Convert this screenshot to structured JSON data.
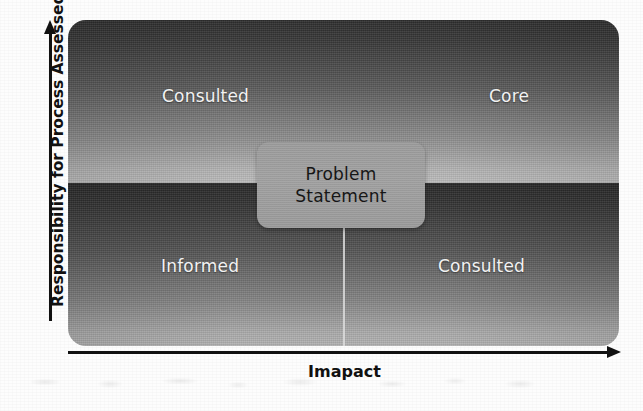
{
  "chart_data": {
    "type": "matrix",
    "title": "",
    "xlabel": "Imapact",
    "ylabel": "Responsibility for Process Assessed",
    "grid": false,
    "legend": "none",
    "axes": {
      "x": {
        "label": "Imapact",
        "arrow": "right",
        "ticks": []
      },
      "y": {
        "label": "Responsibility for Process Assessed",
        "arrow": "up",
        "ticks": []
      }
    },
    "quadrants": [
      {
        "id": "top-left",
        "label": "Consulted",
        "x": "low",
        "y": "high"
      },
      {
        "id": "top-right",
        "label": "Core",
        "x": "high",
        "y": "high"
      },
      {
        "id": "bottom-left",
        "label": "Informed",
        "x": "low",
        "y": "low"
      },
      {
        "id": "bottom-right",
        "label": "Consulted",
        "x": "high",
        "y": "low"
      }
    ],
    "annotations": [
      {
        "id": "center-callout",
        "lines": [
          "Problem",
          "Statement"
        ],
        "position": "center"
      }
    ]
  },
  "matrix": {
    "quadrant_top_left": "Consulted",
    "quadrant_top_right": "Core",
    "quadrant_bottom_left": "Informed",
    "quadrant_bottom_right": "Consulted"
  },
  "problem_box": {
    "line1": "Problem",
    "line2": "Statement"
  },
  "axis": {
    "y_label": "Responsibility for Process Assessed",
    "x_label": "Imapact"
  },
  "colors": {
    "page_background": "#fdfdfd",
    "band_dark": "#2e2e2e",
    "band_light": "#bcbcbc",
    "axis_ink": "#111111",
    "quadrant_label": "#f2f2f2",
    "callout_fill": "#9e9e9e",
    "callout_text": "#161616",
    "connector": "#dcdcdc"
  }
}
